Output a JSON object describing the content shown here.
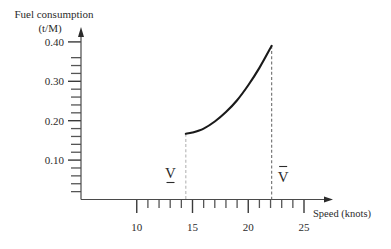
{
  "chart_data": {
    "type": "line",
    "title": "",
    "ylabel": "Fuel consumption",
    "ylabel_unit": "(t/M)",
    "xlabel": "Speed (knots)",
    "xlim": [
      5,
      27
    ],
    "ylim": [
      0,
      0.43
    ],
    "grid": false,
    "legend": null,
    "x_ticks_major": [
      {
        "value": 10,
        "label": "10"
      },
      {
        "value": 15,
        "label": "15"
      },
      {
        "value": 20,
        "label": "20"
      },
      {
        "value": 25,
        "label": "25"
      }
    ],
    "x_ticks_minor": [
      11,
      12,
      13,
      14,
      16,
      17,
      18,
      19,
      21,
      22,
      23,
      24
    ],
    "y_ticks_major": [
      {
        "value": 0.1,
        "label": "0.10"
      },
      {
        "value": 0.2,
        "label": "0.20"
      },
      {
        "value": 0.3,
        "label": "0.30"
      },
      {
        "value": 0.4,
        "label": "0.40"
      }
    ],
    "y_ticks_minor": [
      0.02,
      0.04,
      0.06,
      0.08,
      0.12,
      0.14,
      0.16,
      0.18,
      0.22,
      0.24,
      0.26,
      0.28,
      0.32,
      0.34,
      0.36
    ],
    "series": [
      {
        "name": "fuel-consumption-curve",
        "x": [
          14.4,
          15,
          16,
          17,
          18,
          19,
          20,
          21,
          22.1
        ],
        "y": [
          0.167,
          0.17,
          0.18,
          0.198,
          0.222,
          0.252,
          0.29,
          0.334,
          0.39
        ]
      }
    ],
    "annotations": [
      {
        "label": "V",
        "decoration": "underline",
        "x": 14.4,
        "y": 0.167,
        "line": "dashed"
      },
      {
        "label": "V",
        "decoration": "overline",
        "x": 22.1,
        "y": 0.39,
        "line": "dashed"
      }
    ],
    "colors": {
      "curve": "#1a1a1a",
      "lower_guide": "#b5b5b5",
      "upper_guide": "#6e6e6e",
      "text": "#2b2b2b"
    }
  }
}
